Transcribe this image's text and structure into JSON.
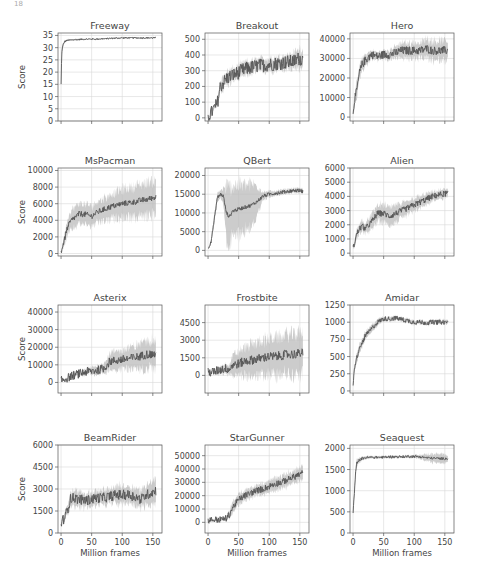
{
  "header": {
    "page_number": "18"
  },
  "chart_data": [
    {
      "type": "line",
      "title": "Freeway",
      "ylabel": "Score",
      "xlabel": "",
      "ylim": [
        0,
        36
      ],
      "yticks": [
        0,
        5,
        10,
        15,
        20,
        25,
        30,
        35
      ],
      "x": [
        0,
        1,
        2,
        4,
        6,
        10,
        20,
        40,
        60,
        80,
        100,
        120,
        140,
        155
      ],
      "mean": [
        15,
        27,
        30,
        31.5,
        32.5,
        33,
        33.2,
        33.5,
        33.5,
        33.8,
        34,
        34,
        34,
        34
      ],
      "band": [
        0.5,
        1,
        1,
        0.8,
        0.5,
        0.3,
        0.3,
        0.2,
        0.2,
        0.2,
        0.2,
        0.2,
        0.2,
        0.2
      ],
      "noise": 0.3
    },
    {
      "type": "line",
      "title": "Breakout",
      "ylabel": "",
      "xlabel": "",
      "ylim": [
        -20,
        540
      ],
      "yticks": [
        0,
        100,
        200,
        300,
        400,
        500
      ],
      "x": [
        0,
        5,
        10,
        15,
        20,
        30,
        40,
        50,
        60,
        80,
        100,
        120,
        140,
        150,
        155
      ],
      "mean": [
        10,
        30,
        60,
        90,
        200,
        250,
        270,
        290,
        310,
        330,
        340,
        350,
        360,
        380,
        370
      ],
      "band": [
        5,
        10,
        15,
        20,
        40,
        40,
        40,
        40,
        40,
        40,
        40,
        40,
        50,
        60,
        60
      ],
      "noise": 45
    },
    {
      "type": "line",
      "title": "Hero",
      "ylabel": "",
      "xlabel": "",
      "ylim": [
        -2000,
        43000
      ],
      "yticks": [
        0,
        10000,
        20000,
        30000,
        40000
      ],
      "x": [
        0,
        3,
        6,
        10,
        15,
        20,
        30,
        40,
        50,
        60,
        70,
        80,
        90,
        100,
        110,
        120,
        130,
        140,
        150,
        155
      ],
      "mean": [
        3000,
        10000,
        13000,
        22000,
        27000,
        29000,
        32000,
        31000,
        32000,
        32000,
        33000,
        34000,
        34000,
        34000,
        34000,
        35000,
        34000,
        34000,
        34000,
        34000
      ],
      "band": [
        2000,
        3000,
        4000,
        4000,
        3000,
        3000,
        2000,
        2000,
        2000,
        2500,
        3000,
        4000,
        4000,
        4000,
        4000,
        5000,
        5000,
        5000,
        5000,
        5000
      ],
      "noise": 2200
    },
    {
      "type": "line",
      "title": "MsPacman",
      "ylabel": "Score",
      "xlabel": "",
      "ylim": [
        -300,
        10300
      ],
      "yticks": [
        0,
        2000,
        4000,
        6000,
        8000,
        10000
      ],
      "x": [
        0,
        5,
        10,
        15,
        20,
        30,
        40,
        50,
        60,
        70,
        80,
        90,
        100,
        110,
        120,
        130,
        140,
        150,
        155
      ],
      "mean": [
        200,
        1500,
        3000,
        3800,
        4200,
        4800,
        4700,
        4500,
        5000,
        5300,
        5600,
        5800,
        6000,
        6100,
        6200,
        6400,
        6500,
        6700,
        6800
      ],
      "band": [
        100,
        600,
        1000,
        1200,
        1200,
        1200,
        1200,
        1200,
        1300,
        1400,
        1500,
        1600,
        1700,
        1800,
        1900,
        1900,
        2000,
        2000,
        2000
      ],
      "noise": 350
    },
    {
      "type": "line",
      "title": "QBert",
      "ylabel": "",
      "xlabel": "",
      "ylim": [
        -1500,
        22000
      ],
      "yticks": [
        0,
        5000,
        10000,
        15000,
        20000
      ],
      "x": [
        0,
        5,
        10,
        15,
        20,
        25,
        30,
        35,
        40,
        50,
        60,
        70,
        80,
        90,
        100,
        110,
        120,
        130,
        140,
        150,
        155
      ],
      "mean": [
        500,
        2500,
        8000,
        14000,
        15000,
        14500,
        10000,
        9000,
        10500,
        11000,
        11500,
        12000,
        13000,
        14500,
        15000,
        15300,
        15500,
        15800,
        16000,
        16000,
        15800
      ],
      "band": [
        200,
        500,
        1000,
        1000,
        1000,
        2000,
        7000,
        7500,
        7000,
        6500,
        6000,
        5500,
        4500,
        1000,
        800,
        600,
        600,
        600,
        600,
        600,
        600
      ],
      "noise": 500
    },
    {
      "type": "line",
      "title": "Alien",
      "ylabel": "",
      "xlabel": "",
      "ylim": [
        -200,
        6000
      ],
      "yticks": [
        0,
        1000,
        2000,
        3000,
        4000,
        5000,
        6000
      ],
      "x": [
        0,
        5,
        10,
        15,
        20,
        30,
        40,
        50,
        60,
        70,
        80,
        90,
        100,
        110,
        120,
        130,
        140,
        150,
        155
      ],
      "mean": [
        300,
        1200,
        1700,
        1900,
        1700,
        2200,
        2800,
        2800,
        2600,
        2800,
        3000,
        3200,
        3400,
        3600,
        3800,
        4000,
        4100,
        4200,
        4200
      ],
      "band": [
        100,
        300,
        400,
        400,
        400,
        500,
        600,
        600,
        600,
        600,
        500,
        500,
        500,
        400,
        400,
        300,
        300,
        300,
        300
      ],
      "noise": 220
    },
    {
      "type": "line",
      "title": "Asterix",
      "ylabel": "Score",
      "xlabel": "",
      "ylim": [
        -6000,
        44000
      ],
      "yticks": [
        0,
        10000,
        20000,
        30000,
        40000
      ],
      "x": [
        0,
        10,
        20,
        30,
        40,
        50,
        60,
        70,
        80,
        90,
        100,
        110,
        120,
        130,
        140,
        150,
        155
      ],
      "mean": [
        1000,
        2500,
        4000,
        5000,
        6000,
        6500,
        7000,
        8000,
        12000,
        12500,
        13000,
        13500,
        14000,
        15000,
        16000,
        16000,
        16000
      ],
      "band": [
        300,
        500,
        800,
        1200,
        1500,
        2000,
        2500,
        3000,
        4500,
        5000,
        5500,
        6000,
        6500,
        7000,
        8000,
        8000,
        8000
      ],
      "noise": 2500
    },
    {
      "type": "line",
      "title": "Frostbite",
      "ylabel": "",
      "xlabel": "",
      "ylim": [
        -1500,
        6000
      ],
      "yticks": [
        0,
        1500,
        3000,
        4500
      ],
      "x": [
        0,
        10,
        20,
        30,
        35,
        40,
        50,
        60,
        70,
        80,
        90,
        100,
        110,
        120,
        130,
        140,
        150,
        155
      ],
      "mean": [
        250,
        300,
        500,
        600,
        500,
        900,
        1000,
        1200,
        1300,
        1400,
        1500,
        1600,
        1600,
        1700,
        1800,
        1800,
        1900,
        1900
      ],
      "band": [
        0,
        100,
        300,
        400,
        400,
        800,
        1000,
        1200,
        1300,
        1400,
        1500,
        1500,
        1600,
        1600,
        1700,
        1700,
        1800,
        1800
      ],
      "noise": 400
    },
    {
      "type": "line",
      "title": "Amidar",
      "ylabel": "",
      "xlabel": "",
      "ylim": [
        -30,
        1250
      ],
      "yticks": [
        0,
        250,
        500,
        750,
        1000,
        1250
      ],
      "x": [
        0,
        2,
        5,
        10,
        15,
        20,
        30,
        40,
        50,
        60,
        70,
        80,
        90,
        100,
        110,
        120,
        130,
        140,
        150,
        155
      ],
      "mean": [
        50,
        300,
        450,
        600,
        700,
        800,
        900,
        1000,
        1050,
        1050,
        1060,
        1040,
        1020,
        1000,
        1000,
        990,
        1000,
        1000,
        1000,
        1000
      ],
      "band": [
        20,
        50,
        60,
        60,
        60,
        60,
        50,
        40,
        30,
        30,
        30,
        30,
        30,
        30,
        30,
        30,
        30,
        30,
        30,
        30
      ],
      "noise": 35
    },
    {
      "type": "line",
      "title": "BeamRider",
      "ylabel": "Score",
      "xlabel": "Million frames",
      "ylim": [
        0,
        6000
      ],
      "yticks": [
        0,
        1500,
        3000,
        4500,
        6000
      ],
      "xticks": [
        0,
        50,
        100,
        150
      ],
      "x": [
        0,
        5,
        10,
        15,
        20,
        30,
        40,
        50,
        60,
        70,
        80,
        90,
        100,
        110,
        120,
        130,
        140,
        150,
        155
      ],
      "mean": [
        700,
        1000,
        1500,
        2300,
        2400,
        2300,
        2200,
        2300,
        2400,
        2400,
        2500,
        2600,
        2600,
        2600,
        2500,
        2300,
        2600,
        2800,
        2900
      ],
      "band": [
        100,
        200,
        300,
        500,
        500,
        500,
        500,
        500,
        500,
        500,
        500,
        600,
        600,
        600,
        600,
        600,
        700,
        800,
        800
      ],
      "noise": 350
    },
    {
      "type": "line",
      "title": "StarGunner",
      "ylabel": "",
      "xlabel": "Million frames",
      "ylim": [
        -8000,
        58000
      ],
      "yticks": [
        0,
        10000,
        20000,
        30000,
        40000,
        50000
      ],
      "xticks": [
        0,
        50,
        100,
        150
      ],
      "x": [
        0,
        10,
        20,
        30,
        35,
        40,
        50,
        60,
        70,
        80,
        90,
        100,
        110,
        120,
        130,
        140,
        150,
        155
      ],
      "mean": [
        1500,
        2000,
        2000,
        3000,
        6000,
        11000,
        17000,
        20000,
        22000,
        24000,
        25000,
        27000,
        29000,
        30000,
        32000,
        34000,
        36000,
        37000
      ],
      "band": [
        200,
        300,
        500,
        1500,
        3000,
        4000,
        4000,
        4000,
        4000,
        4000,
        4000,
        4000,
        4500,
        4500,
        5000,
        5000,
        5000,
        5000
      ],
      "noise": 2500
    },
    {
      "type": "line",
      "title": "Seaquest",
      "ylabel": "",
      "xlabel": "Million frames",
      "ylim": [
        0,
        2080
      ],
      "yticks": [
        0,
        500,
        1000,
        1500,
        2000
      ],
      "xticks": [
        0,
        50,
        100,
        150
      ],
      "x": [
        0,
        2,
        4,
        6,
        8,
        10,
        15,
        20,
        30,
        40,
        50,
        60,
        70,
        80,
        90,
        100,
        110,
        120,
        130,
        140,
        150,
        155
      ],
      "mean": [
        500,
        900,
        1400,
        1650,
        1700,
        1720,
        1760,
        1780,
        1790,
        1790,
        1790,
        1800,
        1800,
        1800,
        1810,
        1810,
        1800,
        1780,
        1770,
        1760,
        1760,
        1760
      ],
      "band": [
        50,
        100,
        100,
        80,
        60,
        50,
        40,
        40,
        30,
        30,
        30,
        30,
        30,
        30,
        30,
        30,
        50,
        80,
        100,
        100,
        100,
        100
      ],
      "noise": 30
    }
  ],
  "xrange": [
    -5,
    165
  ],
  "colors": {
    "line": "#555555",
    "band": "#bbbbbb",
    "grid": "#d9d9d9",
    "axis": "#555555",
    "text": "#444444"
  }
}
